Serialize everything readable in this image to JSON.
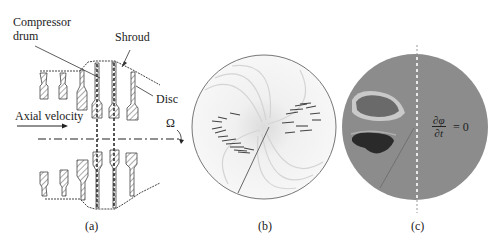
{
  "panel_a": {
    "labels": {
      "compressor_drum_line1": "Compressor",
      "compressor_drum_line2": "drum",
      "shroud": "Shroud",
      "disc": "Disc",
      "axial_velocity": "Axial velocity",
      "omega": "Ω"
    },
    "caption": "(a)"
  },
  "panel_b": {
    "caption": "(b)"
  },
  "panel_c": {
    "equation_numerator": "∂φ",
    "equation_denominator": "∂t",
    "equation_rhs": "= 0",
    "caption": "(c)"
  },
  "colors": {
    "line": "#333333",
    "hatch": "#555555",
    "disc_b_fill": "#f4f4f4",
    "disc_c_fill": "#8c8c8c",
    "dark_region": "#2a2a2a"
  }
}
